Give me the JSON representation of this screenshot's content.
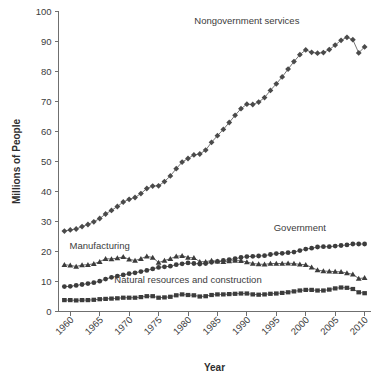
{
  "chart_data": {
    "type": "line",
    "title": "",
    "xlabel": "Year",
    "ylabel": "Millions of People",
    "xlim": [
      1958,
      2011
    ],
    "ylim": [
      0,
      100
    ],
    "grid": false,
    "legend_position": "inline-annotations",
    "x_ticks": [
      "1960",
      "1965",
      "1970",
      "1975",
      "1980",
      "1985",
      "1990",
      "1995",
      "2000",
      "2005",
      "2010"
    ],
    "x_tick_values": [
      1960,
      1965,
      1970,
      1975,
      1980,
      1985,
      1990,
      1995,
      2000,
      2005,
      2010
    ],
    "y_ticks": [
      "0",
      "10",
      "20",
      "30",
      "40",
      "50",
      "60",
      "70",
      "80",
      "90",
      "100"
    ],
    "y_tick_values": [
      0,
      10,
      20,
      30,
      40,
      50,
      60,
      70,
      80,
      90,
      100
    ],
    "x": [
      1959,
      1960,
      1961,
      1962,
      1963,
      1964,
      1965,
      1966,
      1967,
      1968,
      1969,
      1970,
      1971,
      1972,
      1973,
      1974,
      1975,
      1976,
      1977,
      1978,
      1979,
      1980,
      1981,
      1982,
      1983,
      1984,
      1985,
      1986,
      1987,
      1988,
      1989,
      1990,
      1991,
      1992,
      1993,
      1994,
      1995,
      1996,
      1997,
      1998,
      1999,
      2000,
      2001,
      2002,
      2003,
      2004,
      2005,
      2006,
      2007,
      2008,
      2009,
      2010
    ],
    "series": [
      {
        "name": "Nongovernment services",
        "marker": "diamond",
        "color": "#4a4a4a",
        "values": [
          26.8,
          27.2,
          27.5,
          28.3,
          29.0,
          29.9,
          31.0,
          32.5,
          33.7,
          35.0,
          36.5,
          37.4,
          38.0,
          39.3,
          41.0,
          41.8,
          41.9,
          43.3,
          45.2,
          47.6,
          49.8,
          51.0,
          52.2,
          52.5,
          53.8,
          56.4,
          58.6,
          60.7,
          63.0,
          65.4,
          67.6,
          69.1,
          69.0,
          69.8,
          71.3,
          73.7,
          75.9,
          78.2,
          80.8,
          83.3,
          85.6,
          87.2,
          86.4,
          86.1,
          86.3,
          87.3,
          88.8,
          90.4,
          91.4,
          90.6,
          86.2,
          88.2
        ]
      },
      {
        "name": "Government",
        "marker": "circle",
        "color": "#3c3c3c",
        "values": [
          8.3,
          8.4,
          8.7,
          9.0,
          9.3,
          9.6,
          10.1,
          10.8,
          11.4,
          11.8,
          12.2,
          12.6,
          12.9,
          13.3,
          13.7,
          14.2,
          14.7,
          14.9,
          15.1,
          15.6,
          15.9,
          16.2,
          16.0,
          15.8,
          16.0,
          16.4,
          16.7,
          17.0,
          17.3,
          17.6,
          18.0,
          18.3,
          18.4,
          18.5,
          18.6,
          19.0,
          19.3,
          19.4,
          19.6,
          19.8,
          20.3,
          20.8,
          21.1,
          21.5,
          21.6,
          21.6,
          21.8,
          22.0,
          22.2,
          22.5,
          22.5,
          22.5
        ]
      },
      {
        "name": "Manufacturing",
        "marker": "triangle",
        "color": "#3c3c3c",
        "values": [
          15.6,
          15.4,
          15.0,
          15.5,
          15.6,
          15.9,
          16.6,
          17.6,
          17.5,
          17.8,
          18.2,
          17.4,
          17.0,
          17.6,
          18.4,
          18.0,
          16.3,
          17.0,
          17.6,
          18.4,
          18.6,
          18.0,
          17.9,
          16.6,
          16.6,
          17.0,
          16.7,
          16.6,
          16.8,
          17.0,
          16.9,
          16.5,
          16.0,
          15.8,
          15.7,
          16.0,
          16.0,
          16.0,
          16.1,
          16.0,
          15.7,
          15.6,
          14.7,
          13.8,
          13.5,
          13.4,
          13.3,
          13.2,
          12.8,
          12.4,
          11.0,
          11.2
        ]
      },
      {
        "name": "Natural resources and construction",
        "marker": "square",
        "color": "#3c3c3c",
        "values": [
          3.8,
          3.8,
          3.7,
          3.8,
          3.8,
          3.9,
          4.1,
          4.2,
          4.3,
          4.4,
          4.6,
          4.6,
          4.6,
          4.8,
          5.1,
          5.1,
          4.6,
          4.7,
          4.9,
          5.4,
          5.7,
          5.5,
          5.4,
          5.0,
          5.1,
          5.5,
          5.7,
          5.7,
          5.8,
          5.9,
          6.0,
          6.0,
          5.7,
          5.6,
          5.7,
          5.9,
          6.0,
          6.2,
          6.4,
          6.7,
          7.0,
          7.2,
          7.2,
          7.0,
          7.0,
          7.3,
          7.7,
          8.0,
          7.9,
          7.5,
          6.4,
          6.1
        ]
      }
    ],
    "annotations": [
      {
        "text": "Nongovernment services",
        "x": 1990,
        "y": 96
      },
      {
        "text": "Government",
        "x": 1999,
        "y": 27
      },
      {
        "text": "Manufacturing",
        "x": 1965,
        "y": 21
      },
      {
        "text": "Natural resources and construction",
        "x": 1980,
        "y": 9.5
      }
    ]
  },
  "axes": {
    "ylabel": "Millions of People",
    "xlabel": "Year"
  },
  "footer": {
    "partial_text": ""
  }
}
